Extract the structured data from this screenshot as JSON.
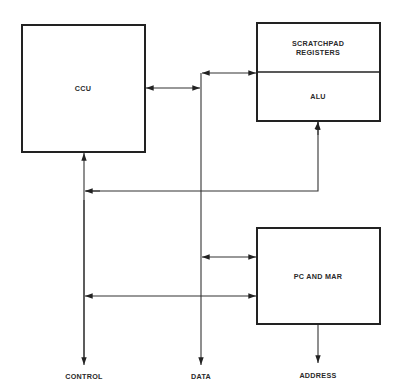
{
  "diagram": {
    "title": "",
    "blocks": {
      "ccu": {
        "label": "CCU"
      },
      "scratchpad": {
        "label_line1": "SCRATCHPAD",
        "label_line2": "REGISTERS"
      },
      "alu": {
        "label": "ALU"
      },
      "pc_mar": {
        "label": "PC AND MAR"
      }
    },
    "buses": {
      "control": {
        "label": "CONTROL"
      },
      "data": {
        "label": "DATA"
      },
      "address": {
        "label": "ADDRESS"
      }
    },
    "connections": [
      {
        "from": "data",
        "to": "scratchpad",
        "direction": "bidirectional"
      },
      {
        "from": "data",
        "to": "ccu",
        "direction": "bidirectional"
      },
      {
        "from": "control",
        "to": "ccu",
        "direction": "to-ccu"
      },
      {
        "from": "alu",
        "to": "control",
        "direction": "to-control"
      },
      {
        "from": "data",
        "to": "pc_mar",
        "direction": "bidirectional"
      },
      {
        "from": "control",
        "to": "pc_mar",
        "direction": "bidirectional"
      },
      {
        "from": "pc_mar",
        "to": "address",
        "direction": "to-address"
      }
    ],
    "colors": {
      "line": "#222222",
      "background": "#ffffff"
    }
  }
}
